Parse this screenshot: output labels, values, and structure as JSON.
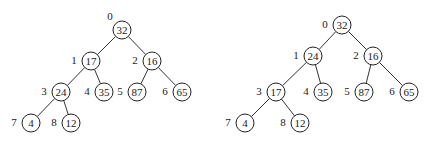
{
  "trees": [
    {
      "name": "heap-before",
      "nodes": [
        {
          "index": "0",
          "value": "32",
          "x": 122,
          "y": 30
        },
        {
          "index": "1",
          "value": "17",
          "x": 91,
          "y": 61
        },
        {
          "index": "2",
          "value": "16",
          "x": 152,
          "y": 61
        },
        {
          "index": "3",
          "value": "24",
          "x": 61,
          "y": 92
        },
        {
          "index": "4",
          "value": "35",
          "x": 104,
          "y": 92
        },
        {
          "index": "5",
          "value": "87",
          "x": 137,
          "y": 92
        },
        {
          "index": "6",
          "value": "65",
          "x": 182,
          "y": 92
        },
        {
          "index": "7",
          "value": "4",
          "x": 31,
          "y": 123
        },
        {
          "index": "8",
          "value": "12",
          "x": 71,
          "y": 123
        }
      ],
      "edges": [
        [
          0,
          1
        ],
        [
          0,
          2
        ],
        [
          1,
          3
        ],
        [
          1,
          4
        ],
        [
          2,
          5
        ],
        [
          2,
          6
        ],
        [
          3,
          7
        ],
        [
          3,
          8
        ]
      ]
    },
    {
      "name": "heap-after",
      "nodes": [
        {
          "index": "0",
          "value": "32",
          "x": 342,
          "y": 25
        },
        {
          "index": "1",
          "value": "24",
          "x": 313,
          "y": 56
        },
        {
          "index": "2",
          "value": "16",
          "x": 373,
          "y": 56
        },
        {
          "index": "3",
          "value": "17",
          "x": 276,
          "y": 92
        },
        {
          "index": "4",
          "value": "35",
          "x": 323,
          "y": 92
        },
        {
          "index": "5",
          "value": "87",
          "x": 364,
          "y": 92
        },
        {
          "index": "6",
          "value": "65",
          "x": 409,
          "y": 92
        },
        {
          "index": "7",
          "value": "4",
          "x": 245,
          "y": 123
        },
        {
          "index": "8",
          "value": "12",
          "x": 300,
          "y": 123
        }
      ],
      "edges": [
        [
          0,
          1
        ],
        [
          0,
          2
        ],
        [
          1,
          3
        ],
        [
          1,
          4
        ],
        [
          2,
          5
        ],
        [
          2,
          6
        ],
        [
          3,
          7
        ],
        [
          3,
          8
        ]
      ]
    }
  ],
  "style": {
    "node_radius": 9,
    "stroke": "#222222",
    "background": "#ffffff"
  }
}
